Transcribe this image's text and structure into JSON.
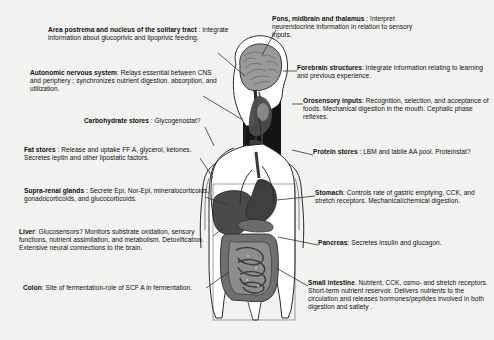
{
  "figure": {
    "background_color": "#f2f2f0",
    "text_color": "#111111",
    "leader_line_color": "#333333",
    "illustration": {
      "name": "human-body-sagittal-illustration",
      "description": "Grayscale line illustration of a human head and torso shown in outline with a mid-sagittal brain section at top, a dark rectangular inset over the head and neck, and shaded abdominal organs including liver, stomach, pancreas, small intestine and colon."
    }
  },
  "callouts": {
    "area_postrema": {
      "term": "Area postrema and nucleus of the solitary tract",
      "separator": " : ",
      "body": "Integrate information about glucoprivic and lipoprivic feeding."
    },
    "autonomic": {
      "term": "Autonomic nervous system",
      "separator": ": ",
      "body": "Relays essential between CNS and periphery ; synchronizes nutrient digestion, absorption, and utilization."
    },
    "carbohydrate": {
      "term": "Carbohydrate stores",
      "separator": " : ",
      "body": "Glycogenostat?"
    },
    "fat": {
      "term": "Fat stores",
      "separator": " : ",
      "body": "Release and uptake FF A, glycerol, ketones. Secretes leptin and other lipostatic factors."
    },
    "supra_renal": {
      "term": "Supra-renal glands",
      "separator": " : ",
      "body": "Secrete Epi, Nor-Epi, mineralocorticoids, gonadocorticoids, and glucocorticoids."
    },
    "liver": {
      "term": "Liver",
      "separator": ": ",
      "body": "Glucosensors? Monitors substrate oxidation, sensory functions, nutrient assimilation, and metabolism. Detoxification. Extensive neural connections to the brain."
    },
    "colon": {
      "term": "Colon",
      "separator": ": ",
      "body": "Site of fermentation-role of SCF A in fermentation."
    },
    "pons": {
      "term": "Pons, midbrain and thalamus",
      "separator": " : ",
      "body": "Interpret neurendocrine information in relation to sensory inputs."
    },
    "forebrain": {
      "term": "Forebrain structures",
      "separator": ": ",
      "body": "Integrate information relating to learning and previous experience."
    },
    "orosensory": {
      "term": "Orosensory inputs",
      "separator": ": ",
      "body": "Recognition, selection, and acceptance of foods. Mechanical digestion in the mouth. Cephalic phase reflexes."
    },
    "protein": {
      "term": "Protein stores",
      "separator": " : ",
      "body": "LBM and labile  AA pool. Proteinstat?"
    },
    "stomach": {
      "term": "Stomach",
      "separator": ": ",
      "body": "Controls rate of gastric emptying, CCK, and stretch receptors. Mechanical/chemical digestion."
    },
    "pancreas": {
      "term": "Pancreas",
      "separator": ": ",
      "body": "Secretes insulin and glucagon."
    },
    "small_intestine": {
      "term": "Small intestine",
      "separator": ". ",
      "body": "Nutrient, CCK, osmo- and stretch receptors.  Short-term nutrient reservoir. Delivers nutrients to the circulation and releases hormones/peptides involved in both digestion and satiety ."
    }
  }
}
